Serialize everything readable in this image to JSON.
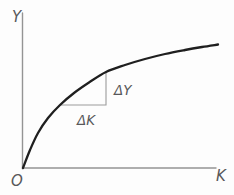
{
  "diagram": {
    "type": "concave-curve-plot",
    "labels": {
      "y_axis": "Y",
      "x_axis": "K",
      "origin": "O",
      "delta_run": "ΔK",
      "delta_rise": "ΔY"
    },
    "curve_points": [
      [
        23,
        168
      ],
      [
        30,
        150
      ],
      [
        38,
        133
      ],
      [
        48,
        118
      ],
      [
        60,
        105
      ],
      [
        74,
        93
      ],
      [
        89,
        82.5
      ],
      [
        106,
        72
      ],
      [
        125,
        65
      ],
      [
        145,
        59
      ],
      [
        165,
        54
      ],
      [
        185,
        50
      ],
      [
        202,
        47
      ],
      [
        218,
        44.5
      ]
    ],
    "slope_triangle": {
      "left_corner": [
        60,
        105
      ],
      "right_angle_corner": [
        106,
        105
      ],
      "top_corner": [
        106,
        72
      ]
    },
    "axes_geometry": {
      "origin": [
        22.5,
        168
      ],
      "y_axis_top": 13,
      "x_axis_right": 216
    },
    "colors": {
      "background": "#fdfdfd",
      "curve": "#1f1f1f",
      "axis": "#949494",
      "triangle": "#9c9c9c",
      "label": "#58585a"
    }
  }
}
